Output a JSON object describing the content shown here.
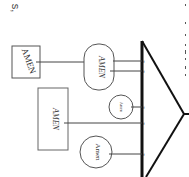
{
  "corner_text": "s,",
  "diagram": {
    "orientation": "rotated-90",
    "nodes": [
      {
        "id": "box-top",
        "shape": "rect",
        "label": "AMEN"
      },
      {
        "id": "oval-top",
        "shape": "rounded-rect",
        "label": "AMEN"
      },
      {
        "id": "box-middle",
        "shape": "rect",
        "label": "AMEN"
      },
      {
        "id": "circle-small",
        "shape": "circle",
        "label": "Amen"
      },
      {
        "id": "circle-bottom",
        "shape": "circle",
        "label": "Amen"
      }
    ],
    "tick_labels": [
      "f",
      "f",
      "f",
      "f",
      "f"
    ]
  }
}
